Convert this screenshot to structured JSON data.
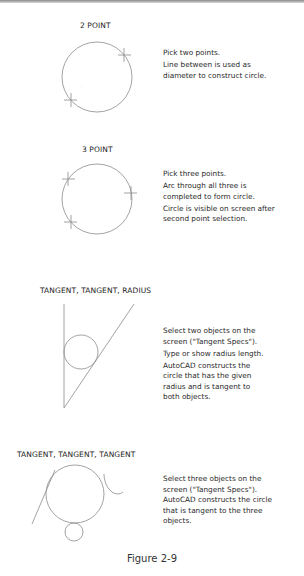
{
  "figure": {
    "caption": "Figure 2-9",
    "sections": [
      {
        "id": "two-point",
        "title": "2 POINT",
        "description": [
          "Pick two points.",
          "Line between is used as diameter to construct circle."
        ]
      },
      {
        "id": "three-point",
        "title": "3 POINT",
        "description": [
          "Pick three points.",
          "Arc through all three is completed to form circle.",
          "Circle is visible on screen after second point selection."
        ]
      },
      {
        "id": "tangent-tangent-radius",
        "title": "TANGENT, TANGENT, RADIUS",
        "description": [
          "Select two objects on the screen (\"Tangent Specs\").",
          "Type or show radius length.",
          "AutoCAD constructs the circle that has the given radius and is tangent to both objects."
        ]
      },
      {
        "id": "tangent-tangent-tangent",
        "title": "TANGENT, TANGENT, TANGENT",
        "description": [
          "Select three objects on the screen (\"Tangent Specs\"). AutoCAD constructs the circle that is tangent to the three objects."
        ]
      }
    ],
    "line_color": "#8c8c8c"
  }
}
